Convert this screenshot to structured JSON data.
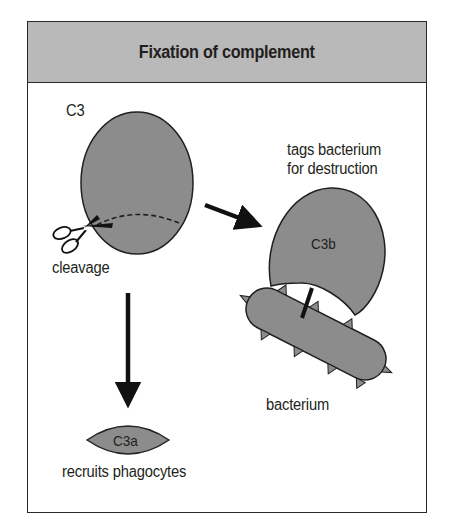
{
  "title": "Fixation of complement",
  "colors": {
    "header_fill": "#b9b9b9",
    "shape_fill": "#8c8c8c",
    "outline": "#231f20",
    "background": "#ffffff"
  },
  "nodes": {
    "c3": {
      "label": "C3",
      "shape": "oval",
      "note": "dashed cleavage line near bottom"
    },
    "cleavage": {
      "label": "cleavage",
      "icon": "scissors"
    },
    "c3b": {
      "label": "C3b",
      "caption_line1": "tags bacterium",
      "caption_line2": "for destruction"
    },
    "bacterium": {
      "label": "bacterium",
      "shape": "spiked rod"
    },
    "c3a": {
      "label": "C3a",
      "caption": "recruits phagocytes"
    }
  },
  "edges": [
    {
      "from": "c3",
      "to": "c3b",
      "style": "solid-arrow"
    },
    {
      "from": "c3",
      "to": "c3a",
      "style": "solid-arrow"
    },
    {
      "from": "c3b",
      "to": "bacterium",
      "style": "attachment-line"
    }
  ]
}
